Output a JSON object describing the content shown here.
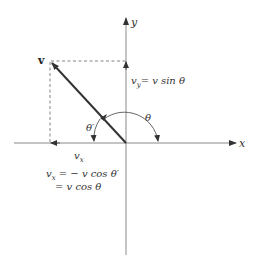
{
  "diagram": {
    "axes": {
      "x_label": "x",
      "y_label": "y"
    },
    "vector": {
      "label": "v",
      "tip": [
        50,
        61
      ],
      "origin": [
        126,
        143
      ]
    },
    "angles": {
      "theta": "θ",
      "theta_prime": "θ′"
    },
    "components": {
      "vx_label": "v",
      "vx_sub": "x",
      "vy_equation_lhs": "v",
      "vy_sub": "y",
      "vy_equation_rhs": "= v sin θ",
      "vx_equation_line1_lhs": "v",
      "vx_equation_line1_sub": "x",
      "vx_equation_line1_rhs": " = − v cos θ′",
      "vx_equation_line2": "= v cos θ"
    },
    "colors": {
      "axis": "#888888",
      "vector": "#333333",
      "dashed": "#777777",
      "text": "#333333"
    }
  }
}
